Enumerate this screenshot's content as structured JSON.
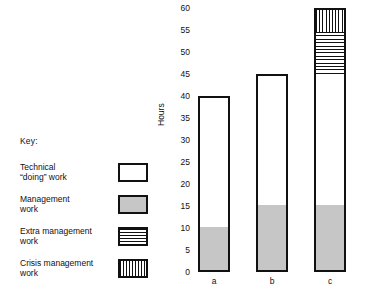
{
  "legend": {
    "title": "Key:",
    "items": [
      {
        "label": "Technical\n“doing” work",
        "swatch": "white-swatch",
        "fill": "white"
      },
      {
        "label": "Management\nwork",
        "swatch": "gray-swatch",
        "fill": "gray"
      },
      {
        "label": "Extra management\nwork",
        "swatch": "horizontal-stripe-swatch",
        "fill": "hstripe"
      },
      {
        "label": "Crisis management\nwork",
        "swatch": "vertical-stripe-swatch",
        "fill": "vstripe"
      }
    ]
  },
  "axis": {
    "ylabel": "Hours",
    "ticks": [
      "0",
      "5",
      "10",
      "15",
      "20",
      "25",
      "30",
      "35",
      "40",
      "45",
      "50",
      "55",
      "60"
    ]
  },
  "categories": [
    "a",
    "b",
    "c"
  ],
  "colors": {
    "outline": "#111111",
    "gray_fill": "#c6c6c6",
    "background": "#ffffff"
  },
  "chart_data": {
    "type": "bar",
    "title": "",
    "xlabel": "",
    "ylabel": "Hours",
    "ylim": [
      0,
      60
    ],
    "ytick_step": 5,
    "grid": false,
    "stacked": true,
    "legend_position": "left",
    "categories": [
      "a",
      "b",
      "c"
    ],
    "series": [
      {
        "name": "Technical “doing” work",
        "fill": "white",
        "values": [
          30,
          30,
          30
        ]
      },
      {
        "name": "Management work",
        "fill": "gray",
        "values": [
          10,
          15,
          15
        ]
      },
      {
        "name": "Extra management work",
        "fill": "hstripe",
        "values": [
          0,
          0,
          10
        ]
      },
      {
        "name": "Crisis management work",
        "fill": "vstripe",
        "values": [
          0,
          0,
          5
        ]
      }
    ],
    "totals": [
      40,
      45,
      60
    ],
    "segment_boundaries": {
      "a": [
        {
          "from": 0,
          "to": 10,
          "fill": "gray"
        },
        {
          "from": 10,
          "to": 40,
          "fill": "white"
        }
      ],
      "b": [
        {
          "from": 0,
          "to": 15,
          "fill": "gray"
        },
        {
          "from": 15,
          "to": 45,
          "fill": "white"
        }
      ],
      "c": [
        {
          "from": 0,
          "to": 15,
          "fill": "gray"
        },
        {
          "from": 15,
          "to": 45,
          "fill": "white"
        },
        {
          "from": 45,
          "to": 55,
          "fill": "hstripe"
        },
        {
          "from": 55,
          "to": 60,
          "fill": "vstripe"
        }
      ]
    }
  }
}
